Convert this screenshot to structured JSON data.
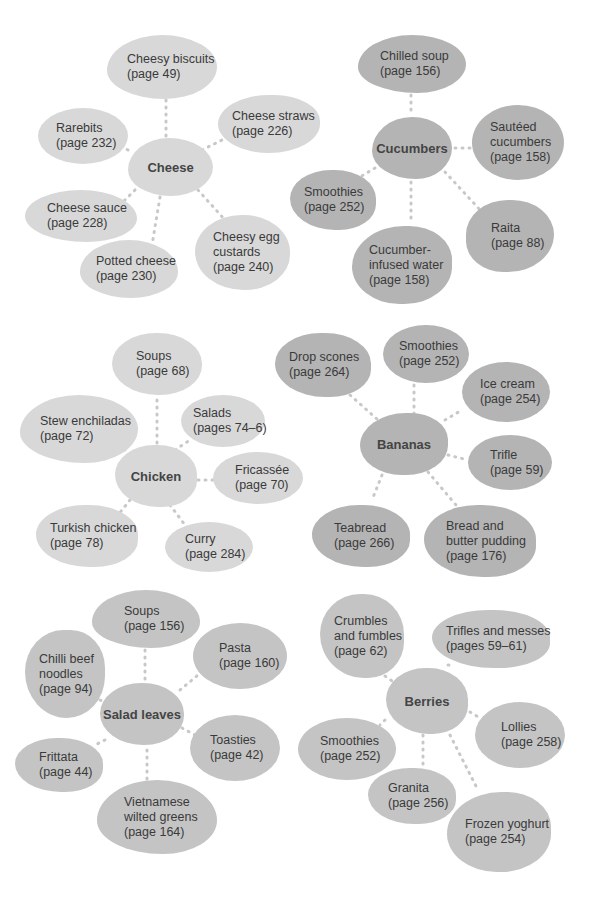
{
  "groups": [
    {
      "hub": "Cheese",
      "items": [
        {
          "name": "Cheesy biscuits",
          "page": "(page 49)"
        },
        {
          "name": "Rarebits",
          "page": "(page 232)"
        },
        {
          "name": "Cheese straws",
          "page": "(page 226)"
        },
        {
          "name": "Cheese sauce",
          "page": "(page 228)"
        },
        {
          "name": "Potted cheese",
          "page": "(page 230)"
        },
        {
          "name": "Cheesy egg custards",
          "page": "(page 240)"
        }
      ]
    },
    {
      "hub": "Cucumbers",
      "items": [
        {
          "name": "Chilled soup",
          "page": "(page 156)"
        },
        {
          "name": "Sautéed cucumbers",
          "page": "(page 158)"
        },
        {
          "name": "Smoothies",
          "page": "(page 252)"
        },
        {
          "name": "Raita",
          "page": "(page 88)"
        },
        {
          "name": "Cucumber-infused water",
          "page": "(page 158)"
        }
      ]
    },
    {
      "hub": "Chicken",
      "items": [
        {
          "name": "Soups",
          "page": "(page 68)"
        },
        {
          "name": "Stew enchiladas",
          "page": "(page 72)"
        },
        {
          "name": "Salads",
          "page": "(pages 74–6)"
        },
        {
          "name": "Fricassée",
          "page": "(page 70)"
        },
        {
          "name": "Turkish chicken",
          "page": "(page 78)"
        },
        {
          "name": "Curry",
          "page": "(page 284)"
        }
      ]
    },
    {
      "hub": "Bananas",
      "items": [
        {
          "name": "Drop scones",
          "page": "(page 264)"
        },
        {
          "name": "Smoothies",
          "page": "(page 252)"
        },
        {
          "name": "Ice cream",
          "page": "(page 254)"
        },
        {
          "name": "Trifle",
          "page": "(page 59)"
        },
        {
          "name": "Teabread",
          "page": "(page 266)"
        },
        {
          "name": "Bread and butter pudding",
          "page": "(page 176)"
        }
      ]
    },
    {
      "hub": "Salad leaves",
      "items": [
        {
          "name": "Soups",
          "page": "(page 156)"
        },
        {
          "name": "Chilli beef noodles",
          "page": "(page 94)"
        },
        {
          "name": "Pasta",
          "page": "(page 160)"
        },
        {
          "name": "Toasties",
          "page": "(page 42)"
        },
        {
          "name": "Frittata",
          "page": "(page 44)"
        },
        {
          "name": "Vietnamese wilted greens",
          "page": "(page 164)"
        }
      ]
    },
    {
      "hub": "Berries",
      "items": [
        {
          "name": "Crumbles and fumbles",
          "page": "(page 62)"
        },
        {
          "name": "Trifles and messes",
          "page": "(pages 59–61)"
        },
        {
          "name": "Smoothies",
          "page": "(page 252)"
        },
        {
          "name": "Lollies",
          "page": "(page 258)"
        },
        {
          "name": "Granita",
          "page": "(page 256)"
        },
        {
          "name": "Frozen yoghurt",
          "page": "(page 254)"
        }
      ]
    }
  ],
  "lines": {
    "cheese_1": "Cheesy biscuits",
    "cheese_2": "(page 49)",
    "rare_1": "Rarebits",
    "rare_2": "(page 232)",
    "straw_1": "Cheese straws",
    "straw_2": "(page 226)",
    "sauce_1": "Cheese sauce",
    "sauce_2": "(page 228)",
    "potted_1": "Potted cheese",
    "potted_2": "(page 230)",
    "egg_1": "Cheesy egg",
    "egg_2": "custards",
    "egg_3": "(page 240)",
    "chilled_1": "Chilled soup",
    "chilled_2": "(page 156)",
    "saute_1": "Sautéed",
    "saute_2": "cucumbers",
    "saute_3": "(page 158)",
    "csmooth_1": "Smoothies",
    "csmooth_2": "(page 252)",
    "raita_1": "Raita",
    "raita_2": "(page 88)",
    "water_1": "Cucumber-",
    "water_2": "infused water",
    "water_3": "(page 158)",
    "ksoup_1": "Soups",
    "ksoup_2": "(page 68)",
    "stew_1": "Stew enchiladas",
    "stew_2": "(page 72)",
    "salads_1": "Salads",
    "salads_2": "(pages 74–6)",
    "fric_1": "Fricassée",
    "fric_2": "(page 70)",
    "turk_1": "Turkish chicken",
    "turk_2": "(page 78)",
    "curry_1": "Curry",
    "curry_2": "(page 284)",
    "drop_1": "Drop scones",
    "drop_2": "(page 264)",
    "bsmooth_1": "Smoothies",
    "bsmooth_2": "(page 252)",
    "ice_1": "Ice cream",
    "ice_2": "(page 254)",
    "trifle_1": "Trifle",
    "trifle_2": "(page 59)",
    "tea_1": "Teabread",
    "tea_2": "(page 266)",
    "bread_1": "Bread and",
    "bread_2": "butter pudding",
    "bread_3": "(page 176)",
    "ssoup_1": "Soups",
    "ssoup_2": "(page 156)",
    "chilli_1": "Chilli beef",
    "chilli_2": "noodles",
    "chilli_3": "(page 94)",
    "pasta_1": "Pasta",
    "pasta_2": "(page 160)",
    "toast_1": "Toasties",
    "toast_2": "(page 42)",
    "fritt_1": "Frittata",
    "fritt_2": "(page 44)",
    "viet_1": "Vietnamese",
    "viet_2": "wilted greens",
    "viet_3": "(page 164)",
    "crumb_1": "Crumbles",
    "crumb_2": "and fumbles",
    "crumb_3": "(page 62)",
    "trifles_1": "Trifles and messes",
    "trifles_2": "(pages 59–61)",
    "rsmooth_1": "Smoothies",
    "rsmooth_2": "(page 252)",
    "lolly_1": "Lollies",
    "lolly_2": "(page 258)",
    "gran_1": "Granita",
    "gran_2": "(page 256)",
    "froz_1": "Frozen yoghurt",
    "froz_2": "(page 254)"
  },
  "colors": {
    "light": "#d8d8d8",
    "mid": "#c4c4c4",
    "dark": "#b4b4b4",
    "connector": "#c8c8c8"
  }
}
